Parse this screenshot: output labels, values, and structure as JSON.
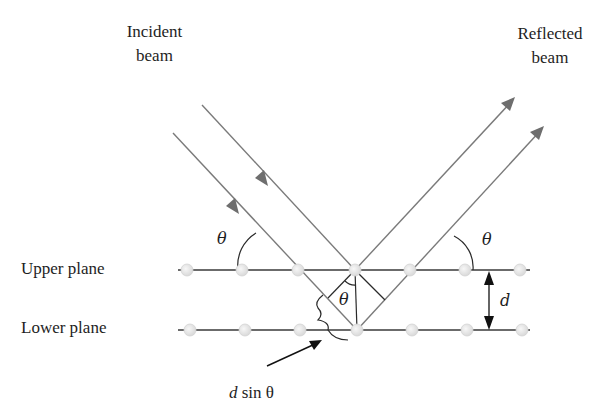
{
  "figure": {
    "labels": {
      "incident_line1": "Incident",
      "incident_line2": "beam",
      "reflected_line1": "Reflected",
      "reflected_line2": "beam",
      "upper_plane": "Upper plane",
      "lower_plane": "Lower plane",
      "theta_left": "θ",
      "theta_right": "θ",
      "theta_inner": "θ",
      "spacing": "d",
      "path_diff_d": "d",
      "path_diff_rest": "sin θ"
    },
    "colors": {
      "beam": "#7a7a7a",
      "plane": "#3a3a3a",
      "atom_fill": "#e6e6e6",
      "atom_stroke": "#d0d0d0",
      "text": "#1e1e1e",
      "construction": "#2a2a2a"
    },
    "planes": [
      {
        "name": "upper",
        "y": 270,
        "atoms_x": [
          187,
          242,
          298,
          355,
          410,
          465,
          520
        ]
      },
      {
        "name": "lower",
        "y": 330,
        "atoms_x": [
          190,
          245,
          300,
          357,
          412,
          467,
          522
        ]
      }
    ],
    "beams": {
      "incident": [
        {
          "from": [
            202,
            105
          ],
          "to": [
            355,
            270
          ]
        },
        {
          "from": [
            173,
            133
          ],
          "to": [
            357,
            330
          ]
        }
      ],
      "reflected": [
        {
          "from": [
            355,
            270
          ],
          "to": [
            515,
            98
          ]
        },
        {
          "from": [
            357,
            330
          ],
          "to": [
            544,
            126
          ]
        }
      ]
    }
  }
}
